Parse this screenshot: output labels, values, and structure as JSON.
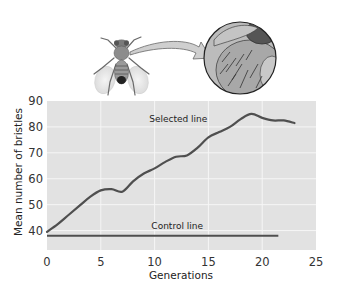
{
  "illustration": {
    "subject": "fruit-fly",
    "magnified_view": "bristles-closeup",
    "arrow": "fly-to-magnified-circle"
  },
  "chart_data": {
    "type": "line",
    "title": "",
    "xlabel": "Generations",
    "ylabel": "Mean number of bristles",
    "xlim": [
      0,
      25
    ],
    "ylim": [
      32.5,
      90
    ],
    "xticks": [
      0,
      5,
      10,
      15,
      20,
      25
    ],
    "yticks": [
      40,
      50,
      60,
      70,
      80,
      90
    ],
    "xtick_labels": [
      "0",
      "5",
      "10",
      "15",
      "20",
      "25"
    ],
    "ytick_labels": [
      "40",
      "50",
      "60",
      "70",
      "80",
      "90"
    ],
    "grid": true,
    "legend": "inline labels",
    "series": [
      {
        "name": "Selected line",
        "x": [
          0,
          1,
          2,
          3,
          4,
          5,
          6,
          7,
          8,
          9,
          10,
          11,
          12,
          13,
          14,
          15,
          16,
          17,
          18,
          19,
          20,
          21,
          22,
          23
        ],
        "values": [
          39.5,
          42.5,
          46,
          49.5,
          53,
          55.5,
          56,
          55,
          59,
          62,
          64,
          66.5,
          68.5,
          69,
          72,
          76,
          78,
          80,
          83,
          85,
          83.5,
          82.5,
          82.5,
          81.5
        ],
        "label_position": {
          "x": 9.5,
          "y": 82
        }
      },
      {
        "name": "Control line",
        "x": [
          0,
          21.5
        ],
        "values": [
          38,
          38
        ],
        "label_position": {
          "x": 9.7,
          "y": 40.5
        }
      }
    ],
    "colors": {
      "plot_background": "#e2e2e2",
      "gridlines": "#f6f6f6",
      "lines": "#4f4f4f"
    }
  }
}
